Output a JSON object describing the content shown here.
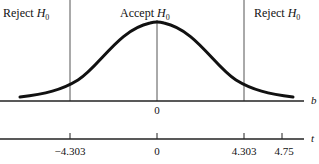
{
  "regions": {
    "reject_left": {
      "text": "Reject ",
      "var": "H",
      "sub": "0"
    },
    "accept": {
      "text": "Accept ",
      "var": "H",
      "sub": "0"
    },
    "reject_right": {
      "text": "Reject ",
      "var": "H",
      "sub": "0"
    }
  },
  "axis_b": {
    "label": "b",
    "ticks": [
      {
        "value": "0"
      }
    ]
  },
  "axis_t": {
    "label": "t",
    "ticks": [
      {
        "value": "−4.303"
      },
      {
        "value": "0"
      },
      {
        "value": "4.303"
      },
      {
        "value": "4.75"
      }
    ]
  },
  "colors": {
    "ink": "#111111",
    "rule": "#555555"
  }
}
